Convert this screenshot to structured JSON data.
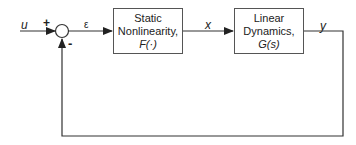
{
  "diagram": {
    "type": "feedback-block-diagram",
    "input_label": "u",
    "summing_junction": {
      "plus_sign": "+",
      "minus_sign": "-"
    },
    "error_label": "ε",
    "intermediate_label": "x",
    "output_label": "y",
    "blocks": [
      {
        "line1": "Static",
        "line2": "Nonlinearity,",
        "line3": "F(·)"
      },
      {
        "line1": "Linear",
        "line2": "Dynamics,",
        "line3": "G(s)"
      }
    ],
    "colors": {
      "line": "#333333",
      "box_border": "#555555",
      "text": "#222222"
    }
  }
}
